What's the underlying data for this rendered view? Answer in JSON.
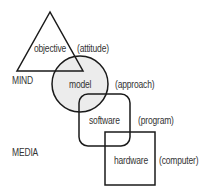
{
  "diagram": {
    "labels": {
      "mind": "MIND",
      "media": "MEDIA"
    },
    "nodes": [
      {
        "id": "objective",
        "shape": "triangle",
        "label": "objective",
        "annotation": "(attitude)"
      },
      {
        "id": "model",
        "shape": "circle",
        "label": "model",
        "annotation": "(approach)",
        "fill": "#ececec"
      },
      {
        "id": "software",
        "shape": "rounded-rectangle",
        "label": "software",
        "annotation": "(program)"
      },
      {
        "id": "hardware",
        "shape": "square",
        "label": "hardware",
        "annotation": "(computer)"
      }
    ],
    "colors": {
      "stroke": "#1a1a1a",
      "circle_fill": "#ececec",
      "text": "#333333"
    }
  }
}
